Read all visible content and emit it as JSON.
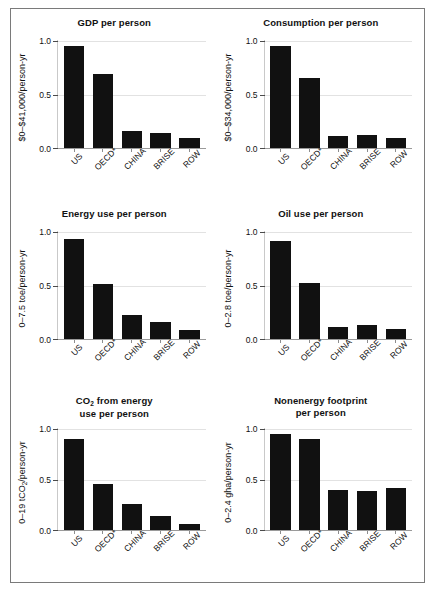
{
  "figure": {
    "categories": [
      "US",
      "OECD*",
      "CHINA",
      "BRISE",
      "ROW"
    ],
    "y_ticks": [
      "0.0",
      "0.5",
      "1.0"
    ]
  },
  "chart_data": [
    {
      "type": "bar",
      "title": "GDP per person",
      "ylabel": "$0–$41,000/person-yr",
      "xlabel": "",
      "categories": [
        "US",
        "OECD*",
        "CHINA",
        "BRISE",
        "ROW"
      ],
      "values": [
        1.0,
        0.73,
        0.17,
        0.145,
        0.1
      ],
      "ylim": [
        0,
        1.05
      ],
      "yticks": [
        0.0,
        0.5,
        1.0
      ],
      "grid": true,
      "legend": "none"
    },
    {
      "type": "bar",
      "title": "Consumption per person",
      "ylabel": "$0–$34,000/person-yr",
      "xlabel": "",
      "categories": [
        "US",
        "OECD*",
        "CHINA",
        "BRISE",
        "ROW"
      ],
      "values": [
        1.0,
        0.69,
        0.115,
        0.13,
        0.1
      ],
      "ylim": [
        0,
        1.05
      ],
      "yticks": [
        0.0,
        0.5,
        1.0
      ],
      "grid": true,
      "legend": "none"
    },
    {
      "type": "bar",
      "title": "Energy use per person",
      "ylabel": "0–7.5 toe/person-yr",
      "xlabel": "",
      "categories": [
        "US",
        "OECD*",
        "CHINA",
        "BRISE",
        "ROW"
      ],
      "values": [
        0.98,
        0.535,
        0.235,
        0.165,
        0.085
      ],
      "ylim": [
        0,
        1.05
      ],
      "yticks": [
        0.0,
        0.5,
        1.0
      ],
      "grid": true,
      "legend": "none"
    },
    {
      "type": "bar",
      "title": "Oil use per person",
      "ylabel": "0–2.8 toe/person-yr",
      "xlabel": "",
      "categories": [
        "US",
        "OECD*",
        "CHINA",
        "BRISE",
        "ROW"
      ],
      "values": [
        0.96,
        0.545,
        0.115,
        0.14,
        0.1
      ],
      "ylim": [
        0,
        1.05
      ],
      "yticks": [
        0.0,
        0.5,
        1.0
      ],
      "grid": true,
      "legend": "none"
    },
    {
      "type": "bar",
      "title": "CO2 from energy\nuse per person",
      "title_line1": "CO",
      "title_sub": "2",
      "title_line1_rest": " from energy",
      "title_line2": "use per person",
      "ylabel": "0–19 tCO2/person-yr",
      "ylabel_pre": "0–19 tCO",
      "ylabel_sub": "2",
      "ylabel_post": "/person-yr",
      "xlabel": "",
      "categories": [
        "US",
        "OECD*",
        "CHINA",
        "BRISE",
        "ROW"
      ],
      "values": [
        0.95,
        0.48,
        0.275,
        0.145,
        0.065
      ],
      "ylim": [
        0,
        1.05
      ],
      "yticks": [
        0.0,
        0.5,
        1.0
      ],
      "grid": true,
      "legend": "none"
    },
    {
      "type": "bar",
      "title": "Nonenergy footprint\nper person",
      "title_line1_rest": "Nonenergy footprint",
      "title_line2": "per person",
      "ylabel": "0–2.4 gha/person-yr",
      "xlabel": "",
      "categories": [
        "US",
        "OECD*",
        "CHINA",
        "BRISE",
        "ROW"
      ],
      "values": [
        1.0,
        0.945,
        0.415,
        0.405,
        0.44
      ],
      "ylim": [
        0,
        1.05
      ],
      "yticks": [
        0.0,
        0.5,
        1.0
      ],
      "grid": true,
      "legend": "none"
    }
  ]
}
